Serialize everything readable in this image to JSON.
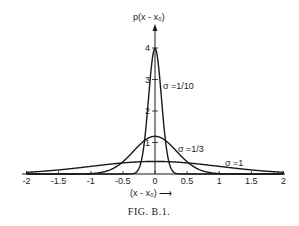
{
  "figure": {
    "caption": "FIG. B.1.",
    "y_axis_label": "p(x - x₀)",
    "x_axis_label": "(x - x₀) ⟶"
  },
  "chart_data": {
    "type": "line",
    "title": "",
    "xlabel": "(x - x0)",
    "ylabel": "p(x - x0)",
    "xlim": [
      -2,
      2
    ],
    "ylim": [
      0,
      4
    ],
    "grid": false,
    "legend_position": "inline labels next to curves",
    "x_ticks": [
      "-2",
      "-1.5",
      "-1",
      "-0.5",
      "0",
      "0.5",
      "1",
      "1.5",
      "2"
    ],
    "y_ticks": [
      "1",
      "2",
      "3",
      "4"
    ],
    "series": [
      {
        "name": "σ = 1/10",
        "sigma": 0.1,
        "peak": 3.99,
        "function": "normal pdf, mean 0"
      },
      {
        "name": "σ = 1/3",
        "sigma": 0.3333,
        "peak": 1.197,
        "function": "normal pdf, mean 0"
      },
      {
        "name": "σ = 1",
        "sigma": 1.0,
        "peak": 0.399,
        "function": "normal pdf, mean 0"
      }
    ],
    "annotations": [
      "σ =1/10",
      "σ =1/3",
      "σ =1"
    ]
  }
}
